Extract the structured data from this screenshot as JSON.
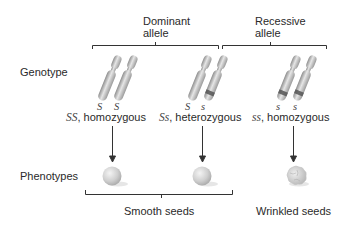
{
  "headers": {
    "dominant": {
      "line1": "Dominant",
      "line2": "allele"
    },
    "recessive": {
      "line1": "Recessive",
      "line2": "allele"
    }
  },
  "row_labels": {
    "genotype": "Genotype",
    "phenotypes": "Phenotypes"
  },
  "columns": [
    {
      "alleles": [
        "S",
        "S"
      ],
      "genotype_symbol": "SS",
      "genotype_desc": ", homozygous",
      "phenotype": "smooth"
    },
    {
      "alleles": [
        "S",
        "s"
      ],
      "genotype_symbol": "Ss",
      "genotype_desc": ", heterozygous",
      "phenotype": "smooth"
    },
    {
      "alleles": [
        "s",
        "s"
      ],
      "genotype_symbol": "ss",
      "genotype_desc": ", homozygous",
      "phenotype": "wrinkled"
    }
  ],
  "phenotype_labels": {
    "smooth": "Smooth seeds",
    "wrinkled": "Wrinkled seeds"
  },
  "colors": {
    "line": "#333333",
    "chromosome": "#b8b8b8",
    "recessive_band": "#555555",
    "seed": "#d4d4d4"
  }
}
